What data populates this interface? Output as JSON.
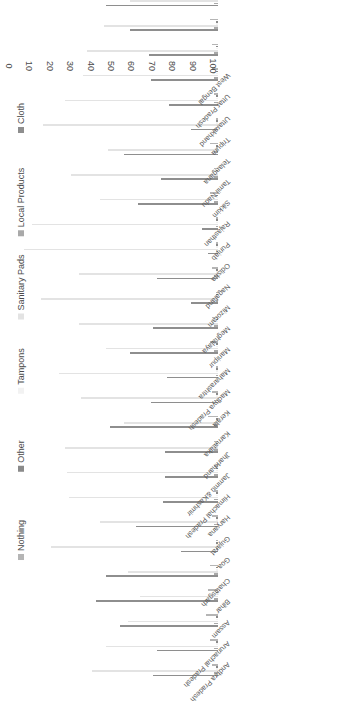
{
  "chart_data": {
    "type": "bar",
    "orientation": "horizontal-grouped",
    "title": "",
    "subtitle": "",
    "xlabel": "",
    "ylabel": "",
    "xlim": [
      0,
      100
    ],
    "grid": false,
    "legend_position": "right",
    "value_ticks": [
      "100",
      "90",
      "80",
      "70",
      "60",
      "50",
      "40",
      "30",
      "20",
      "10",
      "0"
    ],
    "categories": [
      "Andhra Pradesh",
      "Arunachal Pradesh",
      "Assam",
      "Bihar",
      "Chattisgarh",
      "Goa",
      "Gujarat",
      "Haryana",
      "Himachal Pradesh",
      "Jammu &Kashmir",
      "Jharkhand",
      "Karnataka",
      "Kerala",
      "Madhya Pradesh",
      "Maharashtra",
      "Manipur",
      "Meghalaya",
      "Mizoram",
      "Nagaland",
      "Odisha",
      "Punjab",
      "Rajasthan",
      "Sikkim",
      "Tamil Nadu",
      "Telangana",
      "Tripura",
      "Uttarakhand",
      "Uttar Pradesh",
      "West Bengal"
    ],
    "series": [
      {
        "name": "Cloth",
        "color": "#8e8e8e",
        "values": [
          32,
          30,
          48,
          60,
          55,
          18,
          40,
          27,
          26,
          26,
          53,
          33,
          25,
          43,
          32,
          13,
          30,
          5,
          8,
          39,
          28,
          46,
          13,
          24,
          33,
          34,
          43,
          55,
          42
        ]
      },
      {
        "name": "Local Products",
        "color": "#a9a9a9",
        "values": [
          2,
          2,
          2,
          2,
          2,
          1,
          2,
          2,
          2,
          2,
          2,
          2,
          1,
          2,
          2,
          1,
          2,
          1,
          1,
          2,
          2,
          2,
          1,
          2,
          2,
          2,
          2,
          2,
          2
        ]
      },
      {
        "name": "Sanitary Pads",
        "color": "#e3e3e3",
        "values": [
          62,
          55,
          44,
          38,
          44,
          82,
          58,
          73,
          74,
          75,
          46,
          67,
          78,
          55,
          68,
          87,
          68,
          95,
          91,
          58,
          72,
          54,
          86,
          75,
          66,
          64,
          56,
          43,
          57
        ]
      },
      {
        "name": "Tampons",
        "color": "#f2f2f2",
        "values": [
          1,
          1,
          1,
          1,
          1,
          1,
          1,
          1,
          1,
          1,
          1,
          1,
          1,
          1,
          1,
          1,
          1,
          1,
          1,
          1,
          1,
          1,
          1,
          1,
          1,
          1,
          1,
          1,
          1
        ]
      },
      {
        "name": "Other",
        "color": "#8a8a8a",
        "values": [
          1,
          1,
          1,
          1,
          1,
          1,
          1,
          1,
          1,
          1,
          1,
          1,
          1,
          1,
          1,
          1,
          1,
          1,
          1,
          1,
          1,
          1,
          1,
          1,
          1,
          1,
          1,
          1,
          1
        ]
      },
      {
        "name": "Nothing",
        "color": "#b5b5b5",
        "values": [
          3,
          4,
          6,
          5,
          4,
          1,
          3,
          2,
          2,
          2,
          5,
          3,
          1,
          4,
          3,
          1,
          3,
          1,
          1,
          4,
          2,
          4,
          1,
          2,
          3,
          3,
          4,
          5,
          3
        ]
      }
    ],
    "legend": [
      {
        "label": "Cloth",
        "color": "#8e8e8e"
      },
      {
        "label": "Local Products",
        "color": "#a9a9a9"
      },
      {
        "label": "Sanitary Pads",
        "color": "#e3e3e3"
      },
      {
        "label": "Tampons",
        "color": "#f2f2f2"
      },
      {
        "label": "Other",
        "color": "#8a8a8a"
      },
      {
        "label": "Nothing",
        "color": "#b5b5b5"
      }
    ]
  }
}
